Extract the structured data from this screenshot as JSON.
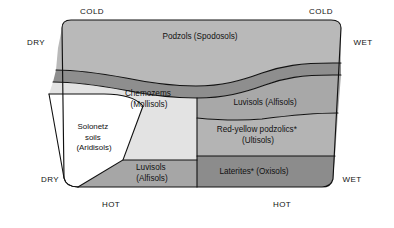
{
  "diagram": {
    "colors": {
      "background": "#ffffff",
      "podzols": "#b9b9b9",
      "dark_band": "#8e8e8e",
      "chernozems": "#e3e3e3",
      "solonetz": "#ffffff",
      "luvisols_upper": "#a8a8a8",
      "red_yellow": "#b4b4b4",
      "luvisols_lower": "#a6a6a6",
      "laterites": "#8c8c8c",
      "outline": "#111111",
      "text": "#111111"
    },
    "axis_labels": {
      "top_left": "COLD",
      "top_right": "COLD",
      "left_upper": "DRY",
      "left_lower": "DRY",
      "right_upper": "WET",
      "right_lower": "WET",
      "bottom_left": "HOT",
      "bottom_right": "HOT"
    },
    "regions": [
      {
        "id": "podzols",
        "name": "podzols-region",
        "lines": [
          "Podzols (Spodosols)"
        ],
        "color": "#b9b9b9",
        "label_x": 200,
        "label_y": 37
      },
      {
        "id": "chernozems",
        "name": "chernozems-region",
        "lines": [
          "Chemozems",
          "(Mollisols)"
        ],
        "color": "#e3e3e3",
        "label_x": 149,
        "label_y": 99
      },
      {
        "id": "solonetz",
        "name": "solonetz-region",
        "lines": [
          "Solonetz",
          "soils",
          "(Aridisols)"
        ],
        "color": "#ffffff",
        "label_x": 94,
        "label_y": 137
      },
      {
        "id": "luvisols-upper",
        "name": "luvisols-upper-region",
        "lines": [
          "Luvisols (Alfisols)"
        ],
        "color": "#a8a8a8",
        "label_x": 265,
        "label_y": 103
      },
      {
        "id": "red-yellow-podzolics",
        "name": "red-yellow-podzolics-region",
        "lines": [
          "Red-yellow podzolics*",
          "(Ultisols)"
        ],
        "color": "#b4b4b4",
        "label_x": 258,
        "label_y": 135
      },
      {
        "id": "luvisols-lower",
        "name": "luvisols-lower-region",
        "lines": [
          "Luvisols",
          "(Alfisols)"
        ],
        "color": "#a6a6a6",
        "label_x": 152,
        "label_y": 173
      },
      {
        "id": "laterites",
        "name": "laterites-region",
        "lines": [
          "Laterites* (Oxisols)"
        ],
        "color": "#8c8c8c",
        "label_x": 254,
        "label_y": 172
      }
    ]
  }
}
